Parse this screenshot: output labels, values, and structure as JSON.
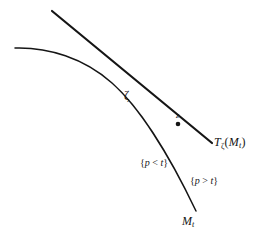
{
  "figure": {
    "kind": "geometry-diagram",
    "background_color": "#ffffff",
    "ink_color": "#151515",
    "width": 266,
    "height": 244
  },
  "labels": {
    "tangency_point": "ζ",
    "tangent_point_marker": "z",
    "tangent_line": {
      "base": "T",
      "base_subscript": "ζ",
      "argument_open": "(",
      "argument_base": "M",
      "argument_subscript": "t",
      "argument_close": ")",
      "plain": "Tζ(Mt)"
    },
    "region_inner": {
      "open": "{",
      "variable": "p",
      "relation": "<",
      "threshold": "t",
      "close": "}",
      "plain": "{p < t}"
    },
    "region_outer": {
      "open": "{",
      "variable": "p",
      "relation": ">",
      "threshold": "t",
      "close": "}",
      "plain": "{p > t}"
    },
    "curve": {
      "base": "M",
      "subscript": "t",
      "plain": "Mt"
    }
  },
  "geometry": {
    "curve_path": "M 15,48 C 48,47 84,58 112,83 C 138,106 168,152 196,211",
    "tangent_path": "M 52,11 L 212,143",
    "tangent_point_dot": {
      "cx": 178,
      "cy": 124,
      "r": 2.3
    },
    "stroke_width_curve": 1.5,
    "stroke_width_tangent": 2.2
  }
}
